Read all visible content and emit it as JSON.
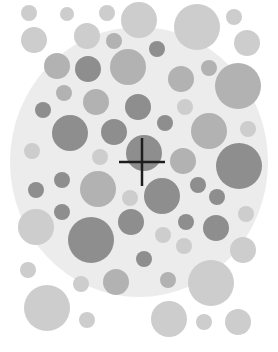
{
  "plate": {
    "background_color": "#ffffff",
    "field": {
      "cx": 139,
      "cy": 162,
      "rx": 129,
      "ry": 135,
      "color": "#ececec"
    },
    "colors": {
      "light": "#cdcdcd",
      "mid": "#b2b2b2",
      "dark": "#8e8e8e"
    },
    "dots": [
      {
        "x": 29,
        "y": 13,
        "r": 8,
        "c": "light"
      },
      {
        "x": 67,
        "y": 14,
        "r": 7,
        "c": "light"
      },
      {
        "x": 107,
        "y": 13,
        "r": 8,
        "c": "light"
      },
      {
        "x": 139,
        "y": 20,
        "r": 18,
        "c": "light"
      },
      {
        "x": 197,
        "y": 27,
        "r": 23,
        "c": "light"
      },
      {
        "x": 234,
        "y": 17,
        "r": 8,
        "c": "light"
      },
      {
        "x": 34,
        "y": 40,
        "r": 13,
        "c": "light"
      },
      {
        "x": 87,
        "y": 36,
        "r": 13,
        "c": "light"
      },
      {
        "x": 114,
        "y": 41,
        "r": 8,
        "c": "mid"
      },
      {
        "x": 157,
        "y": 49,
        "r": 8,
        "c": "dark"
      },
      {
        "x": 247,
        "y": 43,
        "r": 13,
        "c": "light"
      },
      {
        "x": 57,
        "y": 66,
        "r": 13,
        "c": "mid"
      },
      {
        "x": 88,
        "y": 69,
        "r": 13,
        "c": "dark"
      },
      {
        "x": 128,
        "y": 67,
        "r": 18,
        "c": "mid"
      },
      {
        "x": 181,
        "y": 79,
        "r": 13,
        "c": "mid"
      },
      {
        "x": 209,
        "y": 68,
        "r": 8,
        "c": "mid"
      },
      {
        "x": 238,
        "y": 86,
        "r": 23,
        "c": "mid"
      },
      {
        "x": 64,
        "y": 93,
        "r": 8,
        "c": "mid"
      },
      {
        "x": 96,
        "y": 102,
        "r": 13,
        "c": "mid"
      },
      {
        "x": 138,
        "y": 107,
        "r": 13,
        "c": "dark"
      },
      {
        "x": 185,
        "y": 107,
        "r": 8,
        "c": "light"
      },
      {
        "x": 43,
        "y": 110,
        "r": 8,
        "c": "dark"
      },
      {
        "x": 96,
        "y": 5,
        "r": 0,
        "c": "light"
      },
      {
        "x": 70,
        "y": 133,
        "r": 18,
        "c": "dark"
      },
      {
        "x": 114,
        "y": 132,
        "r": 13,
        "c": "dark"
      },
      {
        "x": 165,
        "y": 123,
        "r": 8,
        "c": "dark"
      },
      {
        "x": 209,
        "y": 131,
        "r": 18,
        "c": "mid"
      },
      {
        "x": 248,
        "y": 129,
        "r": 8,
        "c": "light"
      },
      {
        "x": 32,
        "y": 151,
        "r": 8,
        "c": "light"
      },
      {
        "x": 100,
        "y": 157,
        "r": 8,
        "c": "light"
      },
      {
        "x": 144,
        "y": 153,
        "r": 18,
        "c": "dark"
      },
      {
        "x": 183,
        "y": 161,
        "r": 13,
        "c": "mid"
      },
      {
        "x": 239,
        "y": 166,
        "r": 23,
        "c": "dark"
      },
      {
        "x": 62,
        "y": 180,
        "r": 8,
        "c": "dark"
      },
      {
        "x": 98,
        "y": 189,
        "r": 18,
        "c": "mid"
      },
      {
        "x": 162,
        "y": 196,
        "r": 18,
        "c": "dark"
      },
      {
        "x": 198,
        "y": 185,
        "r": 8,
        "c": "dark"
      },
      {
        "x": 36,
        "y": 190,
        "r": 8,
        "c": "dark"
      },
      {
        "x": 130,
        "y": 198,
        "r": 8,
        "c": "light"
      },
      {
        "x": 217,
        "y": 197,
        "r": 8,
        "c": "dark"
      },
      {
        "x": 62,
        "y": 212,
        "r": 8,
        "c": "dark"
      },
      {
        "x": 36,
        "y": 227,
        "r": 18,
        "c": "light"
      },
      {
        "x": 91,
        "y": 240,
        "r": 23,
        "c": "dark"
      },
      {
        "x": 131,
        "y": 222,
        "r": 13,
        "c": "dark"
      },
      {
        "x": 163,
        "y": 235,
        "r": 8,
        "c": "light"
      },
      {
        "x": 186,
        "y": 222,
        "r": 8,
        "c": "dark"
      },
      {
        "x": 216,
        "y": 228,
        "r": 13,
        "c": "dark"
      },
      {
        "x": 246,
        "y": 214,
        "r": 8,
        "c": "light"
      },
      {
        "x": 184,
        "y": 246,
        "r": 8,
        "c": "light"
      },
      {
        "x": 243,
        "y": 250,
        "r": 13,
        "c": "light"
      },
      {
        "x": 144,
        "y": 259,
        "r": 8,
        "c": "dark"
      },
      {
        "x": 28,
        "y": 270,
        "r": 8,
        "c": "light"
      },
      {
        "x": 81,
        "y": 284,
        "r": 8,
        "c": "light"
      },
      {
        "x": 116,
        "y": 282,
        "r": 13,
        "c": "mid"
      },
      {
        "x": 168,
        "y": 280,
        "r": 8,
        "c": "mid"
      },
      {
        "x": 211,
        "y": 283,
        "r": 23,
        "c": "light"
      },
      {
        "x": 47,
        "y": 308,
        "r": 23,
        "c": "light"
      },
      {
        "x": 87,
        "y": 320,
        "r": 8,
        "c": "light"
      },
      {
        "x": 169,
        "y": 319,
        "r": 18,
        "c": "light"
      },
      {
        "x": 204,
        "y": 322,
        "r": 8,
        "c": "light"
      },
      {
        "x": 238,
        "y": 322,
        "r": 13,
        "c": "light"
      }
    ],
    "crosshair": {
      "x": 142,
      "y": 162,
      "half_w": 23,
      "half_h": 24,
      "stroke": 2.5,
      "color": "#1e1e1e"
    }
  },
  "caption": {
    "text": ""
  }
}
